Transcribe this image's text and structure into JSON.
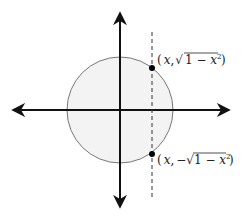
{
  "diagram": {
    "type": "unit-circle-vertical-line",
    "colors": {
      "axis": "#111111",
      "circle_stroke": "#777777",
      "circle_fill": "#f3f3f3",
      "dashed_line": "#333333",
      "point": "#000000"
    },
    "geometry": {
      "center": [
        120,
        110
      ],
      "radius": 53,
      "vertical_line_x": 152
    },
    "points": [
      {
        "label_prefix": "(",
        "var": "x",
        "sep": ",",
        "sign": "",
        "radicand": "1 − x²",
        "suffix": ")"
      },
      {
        "label_prefix": "(",
        "var": "x",
        "sep": ",",
        "sign": "−",
        "radicand": "1 − x²",
        "suffix": ")"
      }
    ],
    "labels": {
      "upper_point": "(x, √(1 − x²))",
      "lower_point": "(x, −√(1 − x²))"
    }
  }
}
